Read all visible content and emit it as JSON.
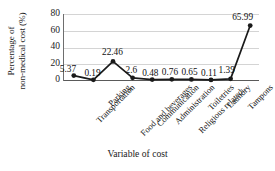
{
  "chart_data": {
    "type": "line",
    "title": "",
    "xlabel": "Variable of cost",
    "ylabel": "Percentage of non-medical cost (%)",
    "ylabel_lines": [
      "Percentage of",
      "non-medical cost (%)"
    ],
    "categories": [
      "Transportation",
      "Parking",
      "Food and beverages",
      "Communication",
      "Administration",
      "Religious related...",
      "Toiletries",
      "Laundry",
      "Tampons",
      "Accommodation"
    ],
    "values": [
      5.37,
      0.19,
      22.46,
      2.6,
      0.48,
      0.76,
      0.65,
      0.11,
      1.39,
      65.99
    ],
    "point_labels": [
      "5.37",
      "0.19",
      "22.46",
      "2.6",
      "0.48",
      "0.76",
      "0.65",
      "0.11",
      "1.39",
      "65.99"
    ],
    "yticks": [
      80,
      60,
      40,
      20,
      0
    ],
    "ytick_labels": [
      "80",
      "60",
      "40",
      "20",
      "0"
    ],
    "ylim": [
      0,
      80
    ],
    "grid": true,
    "legend": "none",
    "series_color": "#1a1a1a",
    "grid_color": "#d4d4d4",
    "axis_color": "#5a5a5a",
    "marker": "filled-circle"
  }
}
